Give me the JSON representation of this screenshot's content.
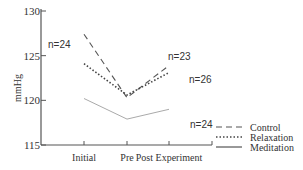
{
  "chart_data": {
    "type": "line",
    "title": "",
    "xlabel": "",
    "ylabel": "mmHg",
    "ylim": [
      115,
      130
    ],
    "yticks": [
      115,
      120,
      125,
      130
    ],
    "categories": [
      "Initial",
      "Pre",
      "Post Experiment"
    ],
    "grid": false,
    "legend_position": "bottom-right",
    "series": [
      {
        "name": "Control",
        "style": "dashed",
        "values": [
          127.4,
          120.3,
          123.9
        ],
        "n_label": "n=23"
      },
      {
        "name": "Relaxation",
        "style": "dotted",
        "values": [
          124.1,
          120.6,
          123.1
        ],
        "n_label": "n=26"
      },
      {
        "name": "Meditation",
        "style": "solid",
        "values": [
          120.2,
          117.9,
          119.0
        ],
        "n_label": "n=24"
      }
    ],
    "annotations": [
      {
        "text": "n=24",
        "near": "Initial (Control/Relaxation)"
      },
      {
        "text": "n=23",
        "near": "Control, Post Experiment"
      },
      {
        "text": "n=26",
        "near": "Relaxation, Post Experiment"
      },
      {
        "text": "n=24",
        "near": "Meditation, Post Experiment"
      }
    ]
  },
  "colors": {
    "axis": "#555555",
    "control": "#555555",
    "relaxation": "#444444",
    "meditation": "#aaaaaa"
  }
}
